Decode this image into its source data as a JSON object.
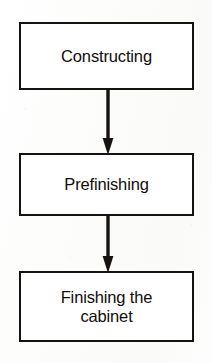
{
  "diagram": {
    "type": "flowchart",
    "orientation": "vertical",
    "background_color": "#fdfdfc",
    "stroke_color": "#15120f",
    "fill_color": "#ffffff",
    "text_color": "#100d0b",
    "nodes": [
      {
        "id": "constructing",
        "label": "Constructing",
        "shape": "rectangle",
        "order": 1
      },
      {
        "id": "prefinishing",
        "label": "Prefinishing",
        "shape": "rectangle",
        "order": 2
      },
      {
        "id": "finishing-cabinet",
        "label": "Finishing the\ncabinet",
        "shape": "rectangle",
        "order": 3
      }
    ],
    "connectors": [
      {
        "id": "connector-1",
        "from": "constructing",
        "to": "prefinishing",
        "style": "solid-arrow",
        "direction": "down"
      },
      {
        "id": "connector-2",
        "from": "prefinishing",
        "to": "finishing-cabinet",
        "style": "solid-arrow",
        "direction": "down"
      }
    ]
  }
}
